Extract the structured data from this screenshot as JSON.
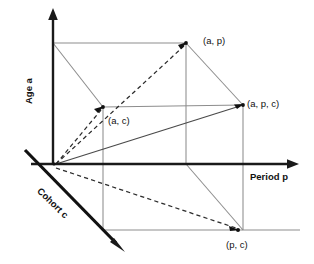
{
  "figure": {
    "type": "lexis-cube-diagram",
    "background_color": "#ffffff",
    "axis_color": "#1a1a1a",
    "box_color": "#8d8d8d",
    "dashed_ray_color": "#2b2b2b"
  },
  "axes": [
    {
      "id": "age",
      "label_prefix": "Age ",
      "label_variable": "a",
      "label_full": "Age a",
      "orientation": "vertical-up",
      "arrow": true
    },
    {
      "id": "period",
      "label_prefix": "Period ",
      "label_variable": "p",
      "label_full": "Period p",
      "orientation": "horizontal-right",
      "arrow": true
    },
    {
      "id": "cohort",
      "label_prefix": "Cohort ",
      "label_variable": "c",
      "label_full": "Cohort c",
      "orientation": "diagonal-down-right",
      "arrow": true
    }
  ],
  "vertices": [
    {
      "id": "ap",
      "label_open": "(",
      "label_text": "a, p",
      "label_close": ")",
      "label_full": "(a, p)"
    },
    {
      "id": "apc",
      "label_open": "(",
      "label_text": "a, p, c",
      "label_close": ")",
      "label_full": "(a, p, c)"
    },
    {
      "id": "ac",
      "label_open": "(",
      "label_text": "a, c",
      "label_close": ")",
      "label_full": "(a, c)"
    },
    {
      "id": "pc",
      "label_open": "(",
      "label_text": "p, c",
      "label_close": ")",
      "label_full": "(p, c)"
    }
  ],
  "origin": {
    "label": ""
  }
}
